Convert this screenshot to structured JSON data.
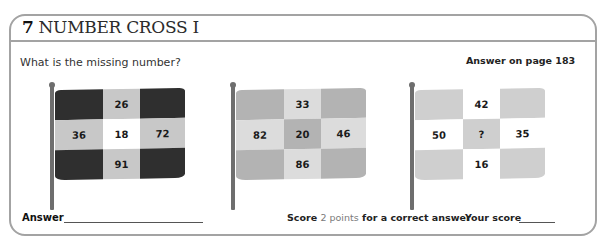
{
  "header": {
    "number": "7",
    "title": "NUMBER CROSS I"
  },
  "question": "What is the missing number?",
  "answer_ref": "Answer on page 183",
  "colors": {
    "border": "#a3a3a3",
    "dark": "#2f2f2f",
    "mid": "#b3b3b3",
    "light": "#d6d6d6",
    "lighter": "#e4e4e4",
    "white": "#ffffff",
    "pole": "#6e6e6e",
    "points_accent": "#7a7a7a"
  },
  "flags": [
    {
      "cells": [
        "",
        "26",
        "",
        "36",
        "18",
        "72",
        "",
        "91",
        ""
      ],
      "fills": [
        "#2f2f2f",
        "#c8c8c8",
        "#2f2f2f",
        "#c8c8c8",
        "#ffffff",
        "#c8c8c8",
        "#2f2f2f",
        "#c8c8c8",
        "#2f2f2f"
      ]
    },
    {
      "cells": [
        "",
        "33",
        "",
        "82",
        "20",
        "46",
        "",
        "86",
        ""
      ],
      "fills": [
        "#b3b3b3",
        "#dcdcdc",
        "#b3b3b3",
        "#dcdcdc",
        "#b3b3b3",
        "#dcdcdc",
        "#b3b3b3",
        "#dcdcdc",
        "#b3b3b3"
      ]
    },
    {
      "cells": [
        "",
        "42",
        "",
        "50",
        "?",
        "35",
        "",
        "16",
        ""
      ],
      "fills": [
        "#cfcfcf",
        "#ffffff",
        "#cfcfcf",
        "#ffffff",
        "#cfcfcf",
        "#ffffff",
        "#cfcfcf",
        "#ffffff",
        "#cfcfcf"
      ]
    }
  ],
  "footer": {
    "answer_label": "Answer",
    "score_prefix": "Score",
    "score_points": "2 points",
    "score_suffix": "for a correct answer",
    "your_score": "Your score"
  }
}
